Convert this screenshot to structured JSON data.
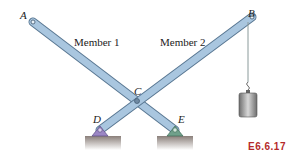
{
  "figure": {
    "id": "E6.6.17",
    "points": {
      "A": "A",
      "B": "B",
      "C": "C",
      "D": "D",
      "E": "E"
    },
    "members": [
      "Member 1",
      "Member 2"
    ]
  },
  "colors": {
    "member": "#a9c6df",
    "member_edge": "#5a7893",
    "cable_left": "#c9a0ae",
    "cable_right": "#9fb7b7",
    "ground": "#a89a93",
    "pin_D": "#9b86c4",
    "pin_E": "#6fa08a",
    "weight": "#8e8e8e",
    "fig_label": "#b52a2a"
  }
}
